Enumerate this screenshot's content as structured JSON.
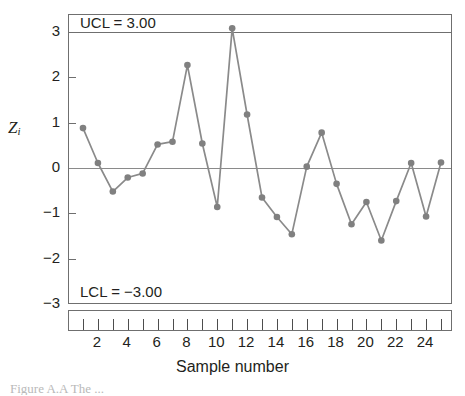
{
  "chart_data": {
    "type": "line",
    "title": "",
    "xlabel": "Sample number",
    "ylabel": "Z_i",
    "ylabel_base": "Z",
    "ylabel_sub": "i",
    "x": [
      1,
      2,
      3,
      4,
      5,
      6,
      7,
      8,
      9,
      10,
      11,
      12,
      13,
      14,
      15,
      16,
      17,
      18,
      19,
      20,
      21,
      22,
      23,
      24,
      25
    ],
    "values": [
      0.88,
      0.11,
      -0.52,
      -0.21,
      -0.12,
      0.52,
      0.58,
      2.27,
      0.54,
      -0.86,
      3.08,
      1.18,
      -0.65,
      -1.08,
      -1.46,
      0.03,
      0.78,
      -0.35,
      -1.24,
      -0.75,
      -1.6,
      -0.73,
      0.11,
      -1.07,
      0.12
    ],
    "ylim": [
      -3.2,
      3.3
    ],
    "xlim": [
      0.5,
      25.5
    ],
    "ytick_labels": [
      "3",
      "2",
      "1",
      "0",
      "−1",
      "−2",
      "−3"
    ],
    "ytick_values": [
      3,
      2,
      1,
      0,
      -1,
      -2,
      -3
    ],
    "xtick_labels": [
      "2",
      "4",
      "6",
      "8",
      "10",
      "12",
      "14",
      "16",
      "18",
      "20",
      "22",
      "24"
    ],
    "xtick_values": [
      2,
      4,
      6,
      8,
      10,
      12,
      14,
      16,
      18,
      20,
      22,
      24
    ],
    "grid": false,
    "legend": "none",
    "control_limits": {
      "ucl_label": "UCL = 3.00",
      "ucl_value": 3.0,
      "lcl_label": "LCL = −3.00",
      "lcl_value": -3.0,
      "center_value": 0
    },
    "series_color": "#808080",
    "marker": "circle",
    "marker_color": "#808080",
    "line_color": "#8a8a8a",
    "axis_color": "#6f6f6f"
  },
  "caption": {
    "text": "Figure  A.A   The ..."
  }
}
